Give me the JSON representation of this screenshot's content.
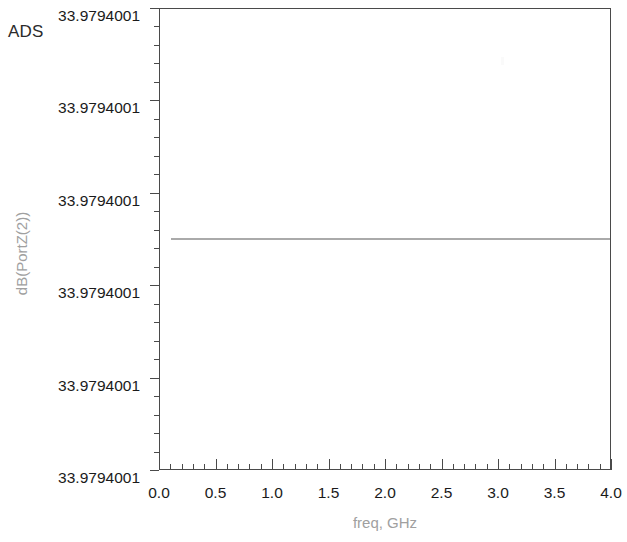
{
  "app": {
    "name": "ADS"
  },
  "chart_data": {
    "type": "line",
    "title": "",
    "xlabel": "freq, GHz",
    "ylabel": "dB(PortZ(2))",
    "xlim": [
      0.0,
      4.0
    ],
    "ylim": [
      33.9794001,
      33.9794001
    ],
    "grid": false,
    "legend": null,
    "x_tick_labels": [
      "0.0",
      "0.5",
      "1.0",
      "1.5",
      "2.0",
      "2.5",
      "3.0",
      "3.5",
      "4.0"
    ],
    "x_tick_values": [
      0.0,
      0.5,
      1.0,
      1.5,
      2.0,
      2.5,
      3.0,
      3.5,
      4.0
    ],
    "x_minor_interval": 0.1,
    "y_tick_labels": [
      "33.9794001",
      "33.9794001",
      "33.9794001",
      "33.9794001",
      "33.9794001",
      "33.9794001"
    ],
    "y_minor_per_major": 4,
    "series": [
      {
        "name": "dB(PortZ(2))",
        "color": "#a5a5a5",
        "x": [
          0.1,
          0.5,
          1.0,
          1.5,
          2.0,
          2.5,
          3.0,
          3.5,
          4.0
        ],
        "values": [
          33.9794001,
          33.9794001,
          33.9794001,
          33.9794001,
          33.9794001,
          33.9794001,
          33.9794001,
          33.9794001,
          33.9794001
        ]
      }
    ],
    "annotations": []
  },
  "colors": {
    "trace": "#a5a5a5",
    "axis": "#4a4a4a",
    "axis_title": "#a0a0a0",
    "tick_label": "#1a1a1a"
  }
}
